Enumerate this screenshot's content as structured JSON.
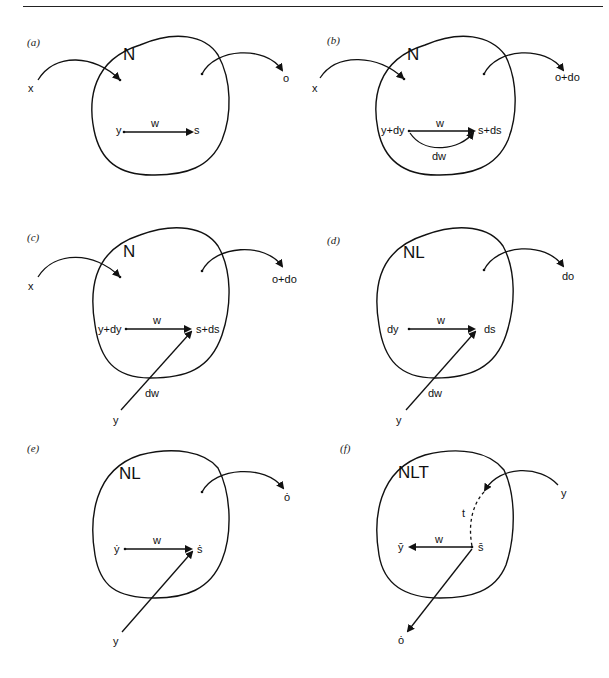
{
  "header": {
    "fragment": "· ·  · ·  ·"
  },
  "panels": [
    {
      "id": "a",
      "label": "(a)",
      "network": "N",
      "input": "x",
      "output": "o",
      "pre": "y",
      "post": "s",
      "weight": "w"
    },
    {
      "id": "b",
      "label": "(b)",
      "network": "N",
      "input": "x",
      "output": "o+do",
      "pre": "y+dy",
      "post": "s+ds",
      "weight": "w",
      "weight_delta": "dw"
    },
    {
      "id": "c",
      "label": "(c)",
      "network": "N",
      "input": "x",
      "output": "o+do",
      "pre": "y+dy",
      "post": "s+ds",
      "weight": "w",
      "weight_delta": "dw",
      "external": "y"
    },
    {
      "id": "d",
      "label": "(d)",
      "network": "NL",
      "output": "do",
      "pre": "dy",
      "post": "ds",
      "weight": "w",
      "weight_delta": "dw",
      "external": "y"
    },
    {
      "id": "e",
      "label": "(e)",
      "network": "NL",
      "output": "ȯ",
      "pre": "ẏ",
      "post": "ṡ",
      "weight": "w",
      "external": "y"
    },
    {
      "id": "f",
      "label": "(f)",
      "network": "NLT",
      "input": "y",
      "output": "ȯ",
      "pre": "ȳ",
      "post": "s̄",
      "weight": "w",
      "transpose": "t"
    }
  ]
}
